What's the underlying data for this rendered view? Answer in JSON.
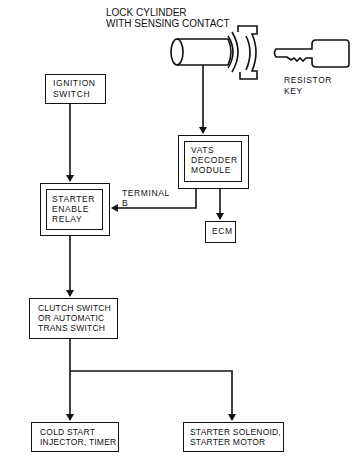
{
  "diagram": {
    "lock_cylinder": {
      "label_line1": "LOCK CYLINDER",
      "label_line2": "WITH SENSING CONTACT"
    },
    "resistor_key": {
      "label_line1": "RESISTOR",
      "label_line2": "KEY"
    },
    "ignition_switch": {
      "line1": "IGNITION",
      "line2": "SWITCH"
    },
    "vats_module": {
      "line1": "VATS",
      "line2": "DECODER",
      "line3": "MODULE"
    },
    "starter_relay": {
      "line1": "STARTER",
      "line2": "ENABLE",
      "line3": "RELAY"
    },
    "terminal_label": {
      "line1": "TERMINAL",
      "line2": "B"
    },
    "ecm": {
      "label": "ECM"
    },
    "clutch_switch": {
      "line1": "CLUTCH SWITCH",
      "line2": "OR AUTOMATIC",
      "line3": "TRANS SWITCH"
    },
    "cold_start": {
      "line1": "COLD START",
      "line2": "INJECTOR, TIMER"
    },
    "starter_solenoid": {
      "line1": "STARTER SOLENOID,",
      "line2": "STARTER MOTOR"
    }
  }
}
